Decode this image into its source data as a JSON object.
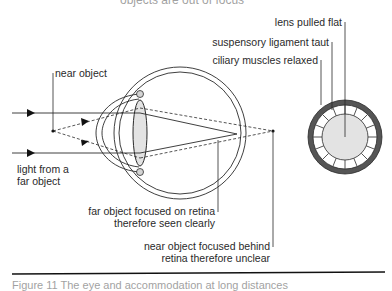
{
  "title": "objects are out of focus",
  "labels": {
    "near_object": "near object",
    "light_far": [
      "light from a",
      "far object"
    ],
    "far_focused": [
      "far object focused on retina",
      "therefore seen clearly"
    ],
    "near_focused": [
      "near object focused behind",
      "retina therefore unclear"
    ],
    "lens_flat": "lens pulled flat",
    "ligament": "suspensory ligament taut",
    "ciliary": "ciliary muscles relaxed"
  },
  "caption": "Figure 11 The eye and accommodation at long distances",
  "colors": {
    "line": "#2a2a2a",
    "lens_fill": "#e6e6e6",
    "ring": "#555555",
    "ciliary_fill": "#cccccc"
  }
}
